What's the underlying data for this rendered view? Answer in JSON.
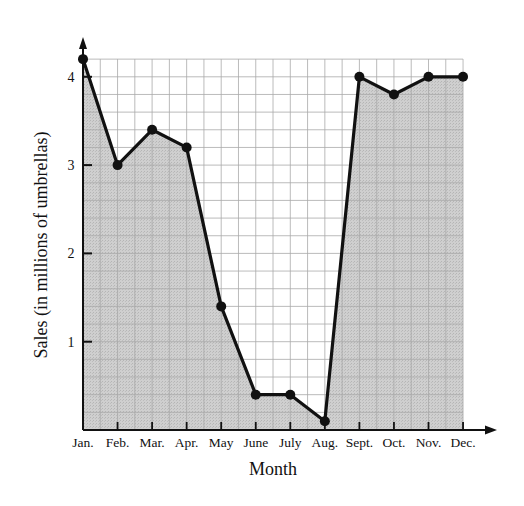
{
  "chart_data": {
    "type": "area",
    "title": "",
    "xlabel": "Month",
    "ylabel": "Sales (in millions of umbrellas)",
    "categories": [
      "Jan.",
      "Feb.",
      "Mar.",
      "Apr.",
      "May",
      "June",
      "July",
      "Aug.",
      "Sept.",
      "Oct.",
      "Nov.",
      "Dec."
    ],
    "series": [
      {
        "name": "Sales",
        "values": [
          4.2,
          3.0,
          3.4,
          3.2,
          1.4,
          0.4,
          0.4,
          0.1,
          4.0,
          3.8,
          4.0,
          4.0
        ]
      }
    ],
    "y_ticks": [
      1,
      2,
      3,
      4
    ],
    "ylim": [
      0,
      4.2
    ],
    "grid": true,
    "grid_minor_y_step": 0.2,
    "grid_minor_x_step": 0.5,
    "legend": "none",
    "markers": true,
    "fill": "shaded area under line"
  },
  "colors": {
    "fill": "#c8c8c8",
    "line": "#111111",
    "grid": "#a9a9a9",
    "grid_unshaded": "#c4c4c4",
    "background": "#ffffff"
  }
}
